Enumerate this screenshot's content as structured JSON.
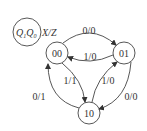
{
  "diagram": {
    "type": "state-diagram",
    "legend": {
      "state_label_q1": "Q",
      "state_sub_q1": "1",
      "state_label_q0": "Q",
      "state_sub_q0": "0",
      "io_label": "X/Z"
    },
    "states": [
      {
        "id": "s00",
        "label": "00"
      },
      {
        "id": "s01",
        "label": "01"
      },
      {
        "id": "s10",
        "label": "10"
      }
    ],
    "transitions": [
      {
        "from": "00",
        "to": "01",
        "label": "0/0"
      },
      {
        "from": "01",
        "to": "00",
        "label": "1/0"
      },
      {
        "from": "00",
        "to": "10",
        "label": "1/1"
      },
      {
        "from": "10",
        "to": "01",
        "label": "1/0"
      },
      {
        "from": "10",
        "to": "00",
        "label": "0/1"
      },
      {
        "from": "01",
        "to": "10",
        "label": "0/0"
      }
    ],
    "colors": {
      "stroke": "#444444",
      "text": "#333333",
      "background": "#ffffff"
    }
  }
}
